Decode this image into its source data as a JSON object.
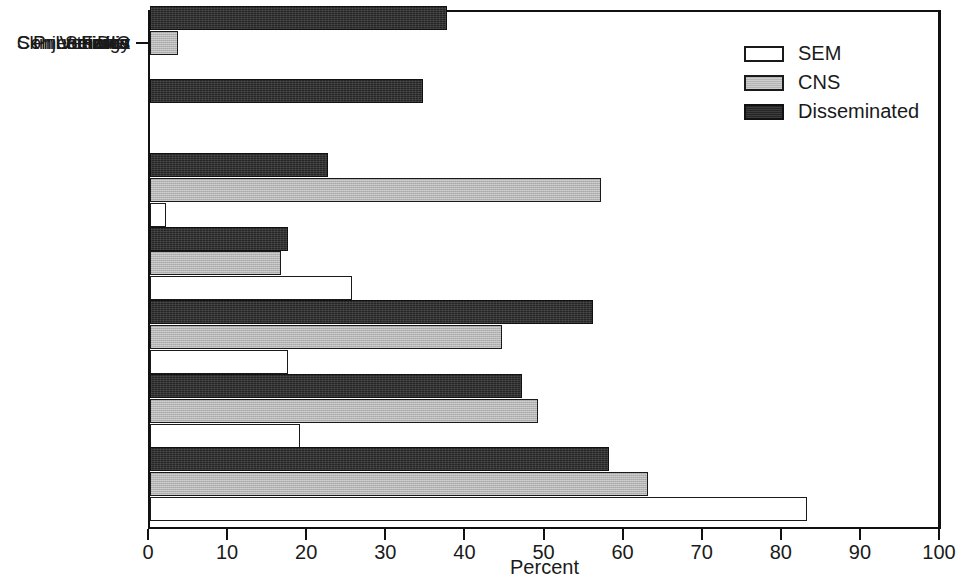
{
  "chart_data": {
    "type": "bar",
    "orientation": "horizontal",
    "title": "",
    "xlabel": "Percent",
    "ylabel": "",
    "xlim": [
      0,
      100
    ],
    "xticks": [
      0,
      10,
      20,
      30,
      40,
      50,
      60,
      70,
      80,
      90,
      100
    ],
    "xtick_labels": [
      "0",
      "10",
      "20",
      "30",
      "40",
      "50",
      "60",
      "70",
      "80",
      "90",
      "100"
    ],
    "grid": false,
    "legend_position": "top-right",
    "categories": [
      "Pneumonia",
      "DIC",
      "Seizure",
      "Conjunctivitis",
      "Fever",
      "Lethargy",
      "Skin Vesicles"
    ],
    "series": [
      {
        "name": "SEM",
        "color": "#ffffff",
        "values": [
          0,
          0,
          2,
          25.5,
          17.5,
          19,
          83
        ]
      },
      {
        "name": "CNS",
        "color": "#b4b4b4",
        "values": [
          3.5,
          0,
          57,
          16.5,
          44.5,
          49,
          63
        ]
      },
      {
        "name": "Disseminated",
        "color": "#262626",
        "values": [
          37.5,
          34.5,
          22.5,
          17.5,
          56,
          47,
          58
        ]
      }
    ]
  },
  "legend": {
    "entries": [
      {
        "label": "SEM",
        "swatch": "sem"
      },
      {
        "label": "CNS",
        "swatch": "cns"
      },
      {
        "label": "Disseminated",
        "swatch": "dis"
      }
    ]
  },
  "axis": {
    "x_title": "Percent"
  }
}
